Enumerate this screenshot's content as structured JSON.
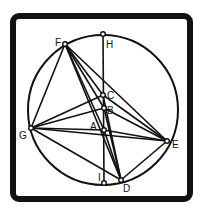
{
  "diagram": {
    "title": "",
    "frame": {
      "x": 13,
      "y": 16,
      "w": 177,
      "h": 183,
      "stroke": 6,
      "radius": 6,
      "color": "#111111"
    },
    "circle": {
      "cx": 103,
      "cy": 110,
      "r": 75,
      "color": "#111111"
    },
    "points": [
      {
        "id": "H",
        "label": "H",
        "x": 103,
        "y": 34,
        "lx": 106,
        "ly": 48
      },
      {
        "id": "F",
        "label": "F",
        "x": 65,
        "y": 44,
        "lx": 55,
        "ly": 46
      },
      {
        "id": "C",
        "label": "C",
        "x": 103,
        "y": 95,
        "lx": 107,
        "ly": 99
      },
      {
        "id": "B",
        "label": "B",
        "x": 104,
        "y": 108,
        "lx": 107,
        "ly": 114
      },
      {
        "id": "A",
        "label": "A",
        "x": 104,
        "y": 130,
        "lx": 90,
        "ly": 130
      },
      {
        "id": "G",
        "label": "G",
        "x": 31,
        "y": 128,
        "lx": 19,
        "ly": 139
      },
      {
        "id": "E",
        "label": "E",
        "x": 167,
        "y": 141,
        "lx": 172,
        "ly": 148
      },
      {
        "id": "I",
        "label": "I",
        "x": 104,
        "y": 183,
        "lx": 98,
        "ly": 181
      },
      {
        "id": "D",
        "label": "D",
        "x": 121,
        "y": 180,
        "lx": 123,
        "ly": 192
      }
    ],
    "segments": [
      [
        "H",
        "I"
      ],
      [
        "F",
        "G"
      ],
      [
        "F",
        "A"
      ],
      [
        "F",
        "B"
      ],
      [
        "F",
        "C"
      ],
      [
        "F",
        "E"
      ],
      [
        "F",
        "D"
      ],
      [
        "G",
        "C"
      ],
      [
        "G",
        "B"
      ],
      [
        "G",
        "A"
      ],
      [
        "G",
        "E"
      ],
      [
        "G",
        "D"
      ],
      [
        "E",
        "C"
      ],
      [
        "E",
        "B"
      ],
      [
        "E",
        "A"
      ],
      [
        "E",
        "D"
      ],
      [
        "A",
        "D"
      ],
      [
        "B",
        "D"
      ],
      [
        "C",
        "D"
      ]
    ]
  }
}
